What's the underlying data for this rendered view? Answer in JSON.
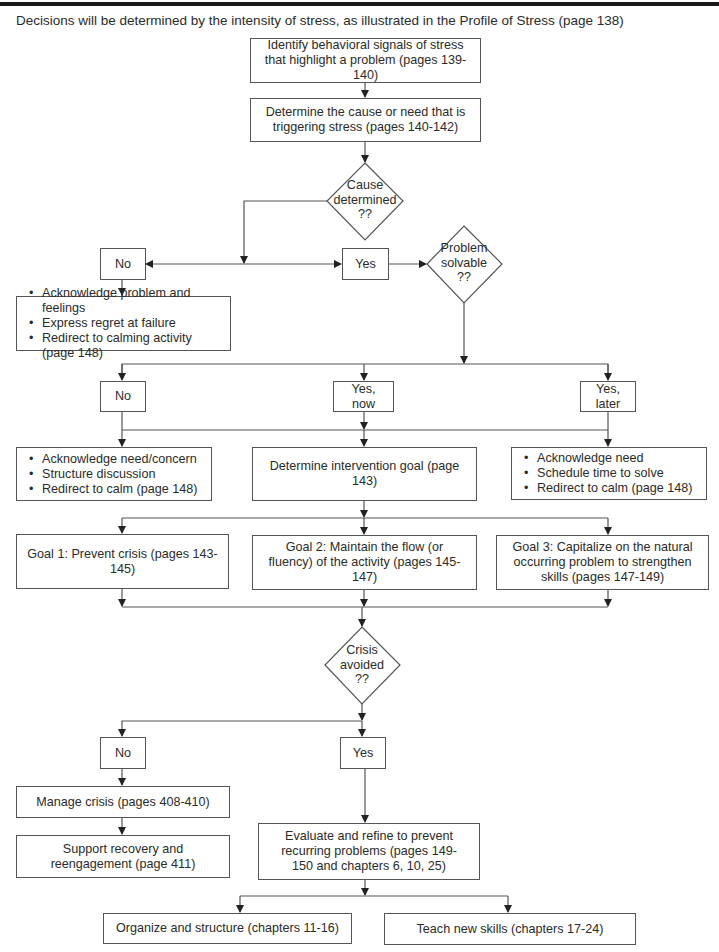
{
  "header": {
    "intro": "Decisions will be determined by the intensity of stress, as illustrated in the Profile of Stress (page 138)"
  },
  "flowchart": {
    "identify": "Identify behavioral signals of stress that highlight a problem (pages 139-140)",
    "determine_cause": "Determine the cause or need that is triggering stress (pages 140-142)",
    "decision_cause": {
      "line1": "Cause",
      "line2": "determined",
      "line3": "??"
    },
    "cause_no": "No",
    "cause_yes": "Yes",
    "cause_no_actions": [
      "Acknowledge problem and feelings",
      "Express regret at failure",
      "Redirect to calming activity (page 148)"
    ],
    "decision_solvable": {
      "line1": "Problem",
      "line2": "solvable",
      "line3": "??"
    },
    "solvable_no": "No",
    "solvable_yes_now": "Yes, now",
    "solvable_yes_later": "Yes, later",
    "no_actions": [
      "Acknowledge need/concern",
      "Structure discussion",
      "Redirect to calm (page 148)"
    ],
    "intervention_goal": "Determine intervention goal (page 143)",
    "later_actions": [
      "Acknowledge need",
      "Schedule time to solve",
      "Redirect to calm (page 148)"
    ],
    "goal1": "Goal 1: Prevent crisis (pages 143-145)",
    "goal2": "Goal 2: Maintain the flow (or fluency) of the activity (pages 145-147)",
    "goal3": "Goal 3: Capitalize on the natural occurring problem to strengthen skills (pages 147-149)",
    "decision_crisis": {
      "line1": "Crisis",
      "line2": "avoided",
      "line3": "??"
    },
    "crisis_no": "No",
    "crisis_yes": "Yes",
    "manage_crisis": "Manage crisis (pages 408-410)",
    "support_recovery": "Support recovery and reengagement (page 411)",
    "evaluate": "Evaluate and refine to prevent recurring problems (pages 149-150 and chapters 6, 10, 25)",
    "organize": "Organize and structure (chapters 11-16)",
    "teach": "Teach new skills (chapters 17-24)"
  }
}
